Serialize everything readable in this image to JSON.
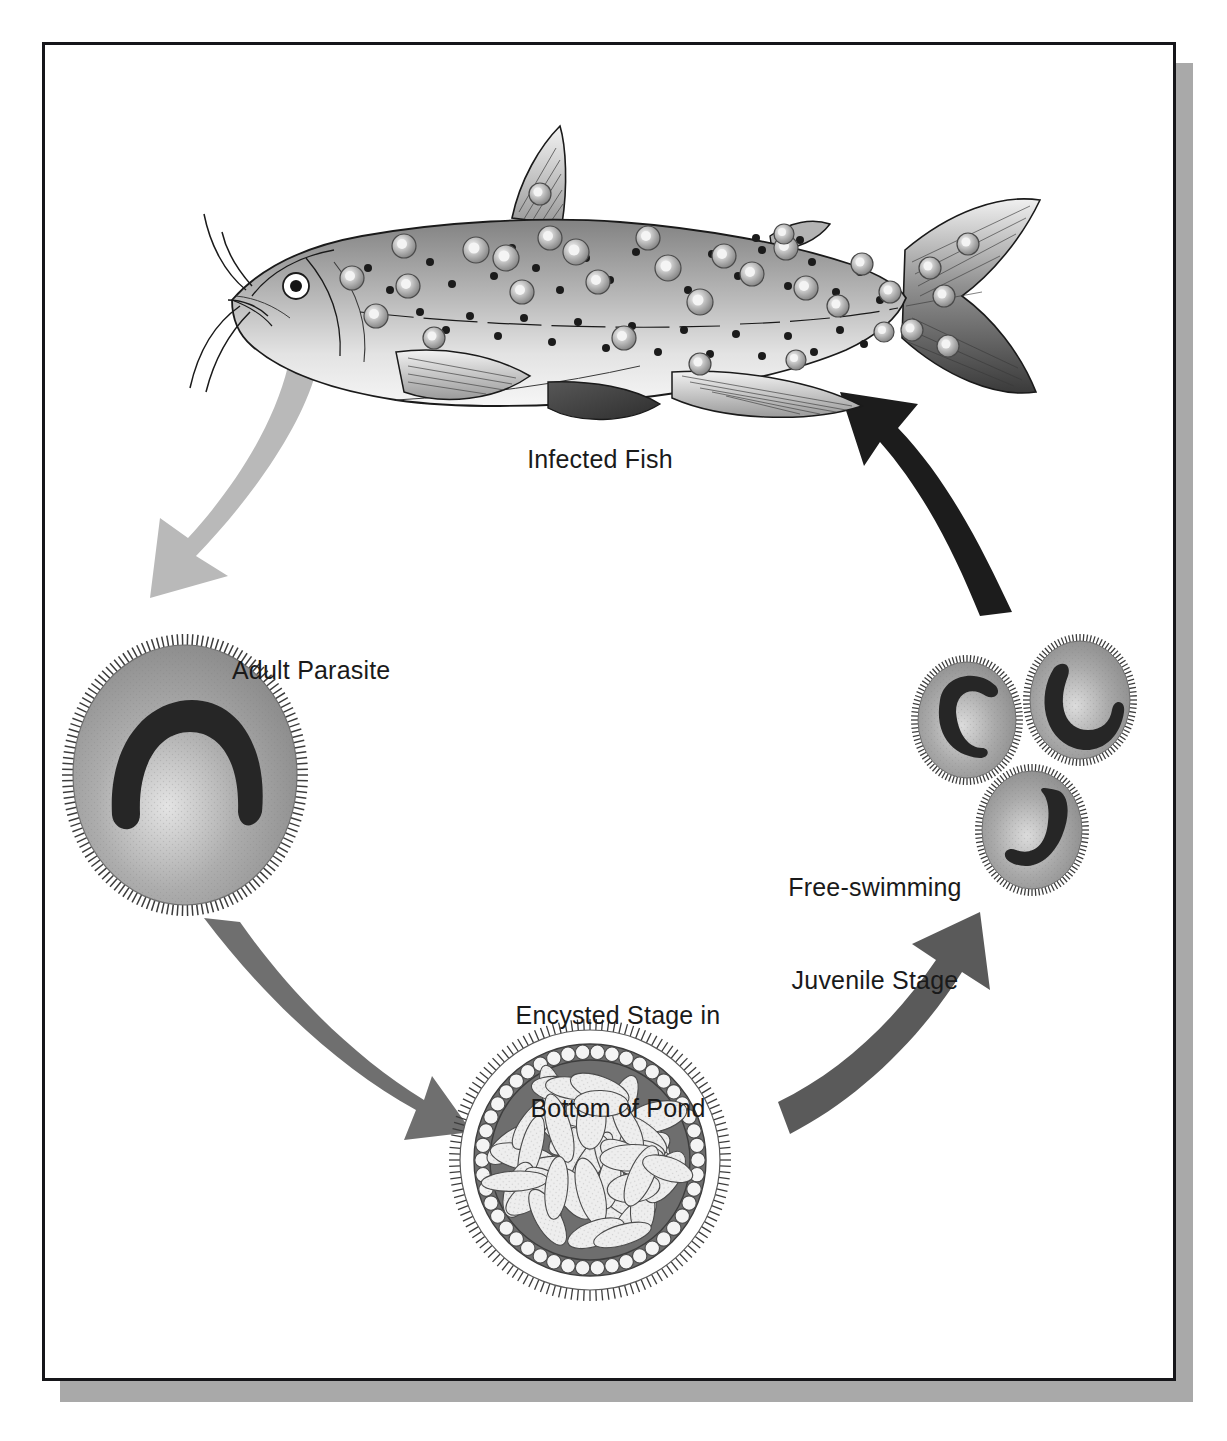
{
  "diagram": {
    "kind": "life-cycle",
    "frame_border_color": "#16161a",
    "frame_shadow_color": "#a9a9a9",
    "background_color": "#ffffff"
  },
  "labels": {
    "infected_fish": "Infected Fish",
    "adult_parasite": "Adult Parasite",
    "free_swimming_line1": "Free-swimming",
    "free_swimming_line2": "Juvenile Stage",
    "encysted_line1": "Encysted Stage in",
    "encysted_line2": "Bottom of Pond"
  },
  "stages": [
    {
      "id": "infected-fish",
      "name": "Infected Fish",
      "description": "Catfish with barbels covered in dark spots and raised white-spot cysts",
      "fill_top": "#8f8f8f",
      "fill_bottom": "#e6e6e6",
      "outline": "#1a1a1a"
    },
    {
      "id": "adult-parasite",
      "name": "Adult Parasite",
      "description": "Large ciliated egg-shaped trophont with dark horseshoe-shaped macronucleus",
      "body_color": "#9a9a9a",
      "nucleus_color": "#262626",
      "cilia_color": "#3a3a3a"
    },
    {
      "id": "encysted-stage",
      "name": "Encysted Stage in Bottom of Pond",
      "description": "Round cyst with ciliated rim, ring of round cells, packed with pale elongated tomites",
      "wall_color": "#6e6e6e",
      "bead_color": "#f4f4f4",
      "tomite_color": "#eeeeee"
    },
    {
      "id": "free-swimming-juveniles",
      "name": "Free-swimming Juvenile Stage",
      "description": "Three small ciliated ovoid theronts with crescent nuclei at differing rotations",
      "count": 3,
      "body_color": "#9e9e9e",
      "nucleus_color": "#262626"
    }
  ],
  "arrows": [
    {
      "id": "fish-to-adult",
      "from": "Infected Fish",
      "to": "Adult Parasite",
      "color": "#b9b9b9",
      "direction": "down-left"
    },
    {
      "id": "adult-to-cyst",
      "from": "Adult Parasite",
      "to": "Encysted Stage in Bottom of Pond",
      "color": "#6f6f6f",
      "direction": "down-right"
    },
    {
      "id": "cyst-to-juvenile",
      "from": "Encysted Stage in Bottom of Pond",
      "to": "Free-swimming Juvenile Stage",
      "color": "#5a5a5a",
      "direction": "up-right"
    },
    {
      "id": "juvenile-to-fish",
      "from": "Free-swimming Juvenile Stage",
      "to": "Infected Fish",
      "color": "#1c1c1c",
      "direction": "up-left"
    }
  ]
}
